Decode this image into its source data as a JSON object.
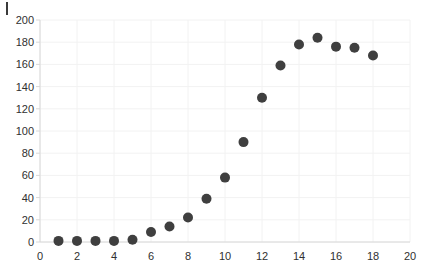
{
  "chart_data": {
    "type": "scatter",
    "title": "",
    "xlabel": "",
    "ylabel": "",
    "xlim": [
      0,
      20
    ],
    "ylim": [
      0,
      200
    ],
    "grid": true,
    "legend": null,
    "marker_color": "#3f3f3f",
    "marker_size": 5,
    "background_color": "#ffffff",
    "grid_color": "#f2f2f2",
    "axis_color": "#d8d8d8",
    "tick_label_color": "#303030",
    "xticks": [
      0,
      2,
      4,
      6,
      8,
      10,
      12,
      14,
      16,
      18,
      20
    ],
    "xtick_labels": [
      "0",
      "2",
      "4",
      "6",
      "8",
      "10",
      "12",
      "14",
      "16",
      "18",
      "20"
    ],
    "yticks": [
      0,
      20,
      40,
      60,
      80,
      100,
      120,
      140,
      160,
      180,
      200
    ],
    "ytick_labels": [
      "0",
      "20",
      "40",
      "60",
      "80",
      "100",
      "120",
      "140",
      "160",
      "180",
      "200"
    ],
    "x": [
      1,
      2,
      3,
      4,
      5,
      6,
      7,
      8,
      9,
      10,
      11,
      12,
      13,
      14,
      15,
      16,
      17,
      18
    ],
    "y": [
      1,
      1,
      1,
      1,
      2,
      9,
      14,
      22,
      39,
      58,
      90,
      130,
      159,
      178,
      184,
      176,
      175,
      168
    ],
    "points": [
      {
        "x": 1,
        "y": 1
      },
      {
        "x": 2,
        "y": 1
      },
      {
        "x": 3,
        "y": 1
      },
      {
        "x": 4,
        "y": 1
      },
      {
        "x": 5,
        "y": 2
      },
      {
        "x": 6,
        "y": 9
      },
      {
        "x": 7,
        "y": 14
      },
      {
        "x": 8,
        "y": 22
      },
      {
        "x": 9,
        "y": 39
      },
      {
        "x": 10,
        "y": 58
      },
      {
        "x": 11,
        "y": 90
      },
      {
        "x": 12,
        "y": 130
      },
      {
        "x": 13,
        "y": 159
      },
      {
        "x": 14,
        "y": 178
      },
      {
        "x": 15,
        "y": 184
      },
      {
        "x": 16,
        "y": 176
      },
      {
        "x": 17,
        "y": 175
      },
      {
        "x": 18,
        "y": 168
      }
    ]
  },
  "plot_area": {
    "left_px": 40,
    "right_px": 410,
    "top_px": 20,
    "bottom_px": 242
  },
  "corner_mark": {
    "label": "cursor-mark"
  }
}
